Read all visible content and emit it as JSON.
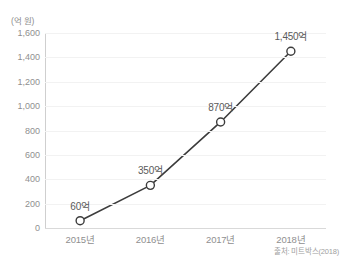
{
  "chart_data": {
    "type": "line",
    "title": "",
    "subtitle": "",
    "xlabel": "",
    "ylabel": "(억 원)",
    "axis_unit_label": "(억 원)",
    "categories": [
      "2015년",
      "2016년",
      "2017년",
      "2018년"
    ],
    "values": [
      60,
      350,
      870,
      1450
    ],
    "point_labels": [
      "60억",
      "350억",
      "870억",
      "1,450억"
    ],
    "series": [
      {
        "name": "거래액",
        "values": [
          60,
          350,
          870,
          1450
        ],
        "labels": [
          "60억",
          "350억",
          "870억",
          "1,450억"
        ]
      }
    ],
    "ylim": [
      0,
      1600
    ],
    "ytick_values": [
      0,
      200,
      400,
      600,
      800,
      1000,
      1200,
      1400,
      1600
    ],
    "ytick_labels": [
      "0",
      "200",
      "400",
      "600",
      "800",
      "1,000",
      "1,200",
      "1,400",
      "1,600"
    ],
    "grid": true,
    "grid_axis": "y",
    "legend": false,
    "legend_position": "none",
    "marker": "open-circle",
    "annotations": [
      "출처: 미트박스(2018)"
    ],
    "source_note": "출처: 미트박스(2018)",
    "colors": {
      "line": "#3c3c3c",
      "marker_stroke": "#3c3c3c",
      "marker_fill": "#ffffff",
      "gridline": "#f2f2f2",
      "axis_line": "#cfcfcf",
      "baseline": "#d9d9d9",
      "tick_text": "#8f8f8f",
      "label_text": "#5a5a5a",
      "source_text": "#a0a0a0",
      "background": "#ffffff"
    }
  }
}
